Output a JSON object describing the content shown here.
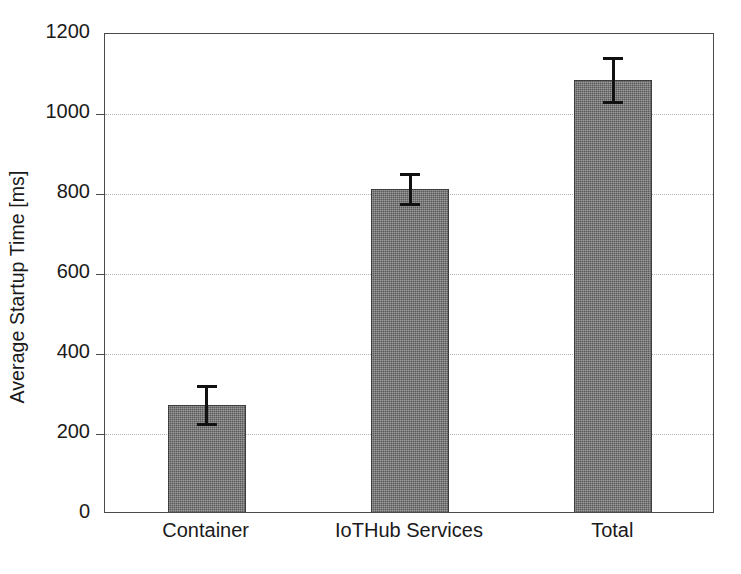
{
  "chart_data": {
    "type": "bar",
    "title": "",
    "xlabel": "",
    "ylabel": "Average Startup Time [ms]",
    "categories": [
      "Container",
      "IoTHub Services",
      "Total"
    ],
    "values": [
      272,
      812,
      1085
    ],
    "errors": [
      47,
      38,
      55
    ],
    "error_type": "symmetric",
    "ylim": [
      0,
      1200
    ],
    "yticks": [
      0,
      200,
      400,
      600,
      800,
      1000,
      1200
    ],
    "ytick_labels": [
      "0",
      "200",
      "400",
      "600",
      "800",
      "1000",
      "1200"
    ],
    "grid": "horizontal-dotted",
    "legend": "none",
    "bar_color": "#5a5a5a",
    "bar_edge_color": "#3d3d3d",
    "error_color": "#111111",
    "axis_color": "#4a4a4a",
    "grid_color": "#b3b3b3",
    "background": "#ffffff",
    "series": [
      {
        "name": "Average Startup Time",
        "values": [
          272,
          812,
          1085
        ],
        "errors": [
          47,
          38,
          55
        ]
      }
    ],
    "points": [
      {
        "category": "Container",
        "value": 272,
        "error": 47,
        "low": 225,
        "high": 319
      },
      {
        "category": "IoTHub Services",
        "value": 812,
        "error": 38,
        "low": 774,
        "high": 850
      },
      {
        "category": "Total",
        "value": 1085,
        "error": 55,
        "low": 1030,
        "high": 1140
      }
    ]
  }
}
